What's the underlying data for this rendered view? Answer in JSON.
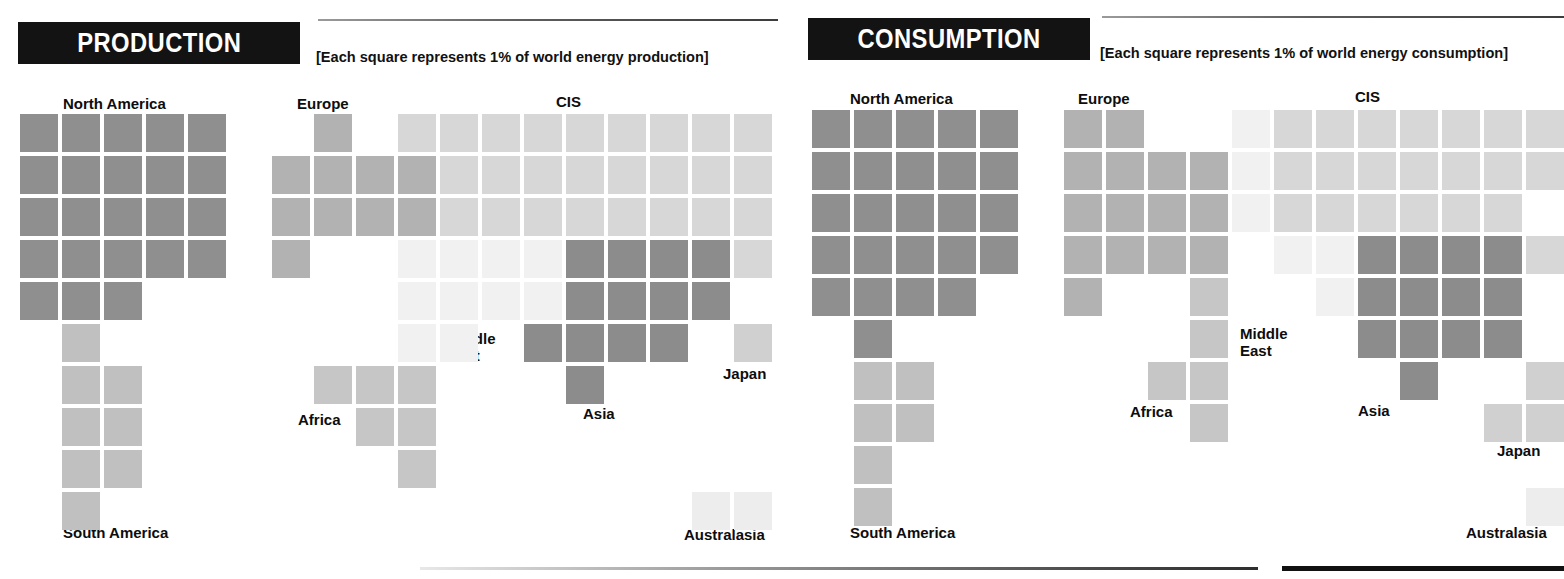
{
  "panels": [
    {
      "id": "production",
      "title": "PRODUCTION",
      "caption": "[Each square represents 1% of world energy production]",
      "labels": {
        "north_america": "North America",
        "south_america": "South America",
        "europe": "Europe",
        "africa": "Africa",
        "middle_east": "Middle\nEast",
        "middle_east_line1": "Middle",
        "middle_east_line2": "East",
        "cis": "CIS",
        "asia": "Asia",
        "japan": "Japan",
        "australasia": "Australasia"
      }
    },
    {
      "id": "consumption",
      "title": "CONSUMPTION",
      "caption": "[Each square represents 1% of world energy consumption]",
      "labels": {
        "north_america": "North America",
        "south_america": "South America",
        "europe": "Europe",
        "africa": "Africa",
        "middle_east_line1": "Middle",
        "middle_east_line2": "East",
        "cis": "CIS",
        "asia": "Asia",
        "japan": "Japan",
        "australasia": "Australasia"
      }
    }
  ],
  "colors": {
    "north_america": "#8f8f8f",
    "south_america": "#c0c0c0",
    "europe": "#b2b2b2",
    "africa": "#c6c6c6",
    "middle_east": "#f1f1f1",
    "cis": "#d7d7d7",
    "asia": "#8c8c8c",
    "japan": "#d0d0d0",
    "australasia": "#ededed",
    "banner_bg": "#131313",
    "banner_text": "#ffffff",
    "label_text": "#0d0d0d"
  },
  "chart_data": {
    "type": "waffle",
    "unit": "Each square represents 1% of world energy production/consumption",
    "cell_px": 38,
    "pitch_px": 42,
    "panels": [
      {
        "name": "PRODUCTION",
        "origin": {
          "x": 20,
          "y": 114
        },
        "regions": [
          {
            "name": "North America",
            "color": "#8f8f8f",
            "squares": 23,
            "cells": [
              [
                0,
                0
              ],
              [
                0,
                1
              ],
              [
                0,
                2
              ],
              [
                0,
                3
              ],
              [
                0,
                4
              ],
              [
                1,
                0
              ],
              [
                1,
                1
              ],
              [
                1,
                2
              ],
              [
                1,
                3
              ],
              [
                1,
                4
              ],
              [
                2,
                0
              ],
              [
                2,
                1
              ],
              [
                2,
                2
              ],
              [
                2,
                3
              ],
              [
                2,
                4
              ],
              [
                3,
                0
              ],
              [
                3,
                1
              ],
              [
                3,
                2
              ],
              [
                3,
                3
              ],
              [
                3,
                4
              ],
              [
                4,
                0
              ],
              [
                4,
                1
              ],
              [
                4,
                2
              ]
            ]
          },
          {
            "name": "South America",
            "color": "#c0c0c0",
            "squares": 8,
            "cells": [
              [
                5,
                1
              ],
              [
                6,
                1
              ],
              [
                6,
                2
              ],
              [
                7,
                1
              ],
              [
                7,
                2
              ],
              [
                8,
                1
              ],
              [
                8,
                2
              ],
              [
                9,
                1
              ]
            ]
          },
          {
            "name": "Europe",
            "color": "#b2b2b2",
            "squares": 10,
            "cells": [
              [
                0,
                7
              ],
              [
                1,
                6
              ],
              [
                1,
                7
              ],
              [
                1,
                8
              ],
              [
                1,
                9
              ],
              [
                2,
                6
              ],
              [
                2,
                7
              ],
              [
                2,
                8
              ],
              [
                2,
                9
              ],
              [
                3,
                6
              ]
            ]
          },
          {
            "name": "Middle East",
            "color": "#f1f1f1",
            "squares": 11,
            "cells": [
              [
                3,
                9
              ],
              [
                3,
                10
              ],
              [
                3,
                11
              ],
              [
                3,
                12
              ],
              [
                4,
                9
              ],
              [
                4,
                10
              ],
              [
                4,
                11
              ],
              [
                4,
                12
              ],
              [
                5,
                9
              ],
              [
                5,
                10
              ],
              [
                6,
                9
              ]
            ]
          },
          {
            "name": "Africa",
            "color": "#c6c6c6",
            "squares": 6,
            "cells": [
              [
                6,
                7
              ],
              [
                6,
                8
              ],
              [
                6,
                9
              ],
              [
                7,
                8
              ],
              [
                7,
                9
              ],
              [
                8,
                9
              ]
            ]
          },
          {
            "name": "CIS",
            "color": "#d7d7d7",
            "squares": 27,
            "cells": [
              [
                0,
                9
              ],
              [
                0,
                10
              ],
              [
                0,
                11
              ],
              [
                0,
                12
              ],
              [
                0,
                13
              ],
              [
                0,
                14
              ],
              [
                0,
                15
              ],
              [
                0,
                16
              ],
              [
                0,
                17
              ],
              [
                1,
                10
              ],
              [
                1,
                11
              ],
              [
                1,
                12
              ],
              [
                1,
                13
              ],
              [
                1,
                14
              ],
              [
                1,
                15
              ],
              [
                1,
                16
              ],
              [
                1,
                17
              ],
              [
                2,
                10
              ],
              [
                2,
                11
              ],
              [
                2,
                12
              ],
              [
                2,
                13
              ],
              [
                2,
                14
              ],
              [
                2,
                15
              ],
              [
                2,
                16
              ],
              [
                2,
                17
              ],
              [
                3,
                17
              ]
            ]
          },
          {
            "name": "Asia",
            "color": "#8c8c8c",
            "squares": 15,
            "cells": [
              [
                3,
                13
              ],
              [
                3,
                14
              ],
              [
                3,
                15
              ],
              [
                3,
                16
              ],
              [
                4,
                13
              ],
              [
                4,
                14
              ],
              [
                4,
                15
              ],
              [
                4,
                16
              ],
              [
                5,
                12
              ],
              [
                5,
                13
              ],
              [
                5,
                14
              ],
              [
                5,
                15
              ],
              [
                6,
                13
              ]
            ]
          },
          {
            "name": "Japan",
            "color": "#d0d0d0",
            "squares": 1,
            "cells": [
              [
                5,
                17
              ]
            ]
          },
          {
            "name": "Australasia",
            "color": "#ededed",
            "squares": 2,
            "cells": [
              [
                9,
                16
              ],
              [
                9,
                17
              ]
            ]
          }
        ]
      },
      {
        "name": "CONSUMPTION",
        "origin": {
          "x": 812,
          "y": 110
        },
        "regions": [
          {
            "name": "North America",
            "color": "#8f8f8f",
            "squares": 25,
            "cells": [
              [
                0,
                0
              ],
              [
                0,
                1
              ],
              [
                0,
                2
              ],
              [
                0,
                3
              ],
              [
                0,
                4
              ],
              [
                1,
                0
              ],
              [
                1,
                1
              ],
              [
                1,
                2
              ],
              [
                1,
                3
              ],
              [
                1,
                4
              ],
              [
                2,
                0
              ],
              [
                2,
                1
              ],
              [
                2,
                2
              ],
              [
                2,
                3
              ],
              [
                2,
                4
              ],
              [
                3,
                0
              ],
              [
                3,
                1
              ],
              [
                3,
                2
              ],
              [
                3,
                3
              ],
              [
                3,
                4
              ],
              [
                4,
                0
              ],
              [
                4,
                1
              ],
              [
                4,
                2
              ],
              [
                4,
                3
              ],
              [
                5,
                1
              ]
            ]
          },
          {
            "name": "South America",
            "color": "#c0c0c0",
            "squares": 6,
            "cells": [
              [
                6,
                1
              ],
              [
                6,
                2
              ],
              [
                7,
                1
              ],
              [
                7,
                2
              ],
              [
                8,
                1
              ],
              [
                9,
                1
              ]
            ]
          },
          {
            "name": "Europe",
            "color": "#b2b2b2",
            "squares": 16,
            "cells": [
              [
                0,
                6
              ],
              [
                0,
                7
              ],
              [
                1,
                6
              ],
              [
                1,
                7
              ],
              [
                1,
                8
              ],
              [
                1,
                9
              ],
              [
                2,
                6
              ],
              [
                2,
                7
              ],
              [
                2,
                8
              ],
              [
                2,
                9
              ],
              [
                3,
                6
              ],
              [
                3,
                7
              ],
              [
                3,
                8
              ],
              [
                3,
                9
              ],
              [
                4,
                6
              ],
              [
                4,
                9
              ]
            ]
          },
          {
            "name": "Middle East",
            "color": "#f1f1f1",
            "squares": 7,
            "cells": [
              [
                3,
                11
              ],
              [
                3,
                12
              ],
              [
                4,
                12
              ],
              [
                0,
                10
              ],
              [
                1,
                10
              ],
              [
                2,
                10
              ],
              [
                2,
                11
              ]
            ]
          },
          {
            "name": "Africa",
            "color": "#c6c6c6",
            "squares": 6,
            "cells": [
              [
                5,
                9
              ],
              [
                6,
                8
              ],
              [
                6,
                9
              ],
              [
                7,
                9
              ],
              [
                4,
                9
              ]
            ]
          },
          {
            "name": "CIS",
            "color": "#d7d7d7",
            "squares": 21,
            "cells": [
              [
                0,
                11
              ],
              [
                0,
                12
              ],
              [
                0,
                13
              ],
              [
                0,
                14
              ],
              [
                0,
                15
              ],
              [
                0,
                16
              ],
              [
                0,
                17
              ],
              [
                1,
                11
              ],
              [
                1,
                12
              ],
              [
                1,
                13
              ],
              [
                1,
                14
              ],
              [
                1,
                15
              ],
              [
                1,
                16
              ],
              [
                1,
                17
              ],
              [
                2,
                12
              ],
              [
                2,
                13
              ],
              [
                2,
                14
              ],
              [
                2,
                15
              ],
              [
                2,
                16
              ],
              [
                2,
                11
              ],
              [
                3,
                17
              ]
            ]
          },
          {
            "name": "Asia",
            "color": "#8c8c8c",
            "squares": 16,
            "cells": [
              [
                3,
                13
              ],
              [
                3,
                14
              ],
              [
                3,
                15
              ],
              [
                3,
                16
              ],
              [
                4,
                13
              ],
              [
                4,
                14
              ],
              [
                4,
                15
              ],
              [
                4,
                16
              ],
              [
                5,
                13
              ],
              [
                5,
                14
              ],
              [
                5,
                15
              ],
              [
                5,
                16
              ],
              [
                6,
                14
              ]
            ]
          },
          {
            "name": "Japan",
            "color": "#d0d0d0",
            "squares": 6,
            "cells": [
              [
                5,
                18
              ],
              [
                6,
                17
              ],
              [
                6,
                18
              ],
              [
                7,
                16
              ],
              [
                7,
                17
              ],
              [
                7,
                18
              ]
            ]
          },
          {
            "name": "Australasia",
            "color": "#ededed",
            "squares": 2,
            "cells": [
              [
                9,
                17
              ],
              [
                9,
                18
              ]
            ]
          }
        ]
      }
    ]
  }
}
